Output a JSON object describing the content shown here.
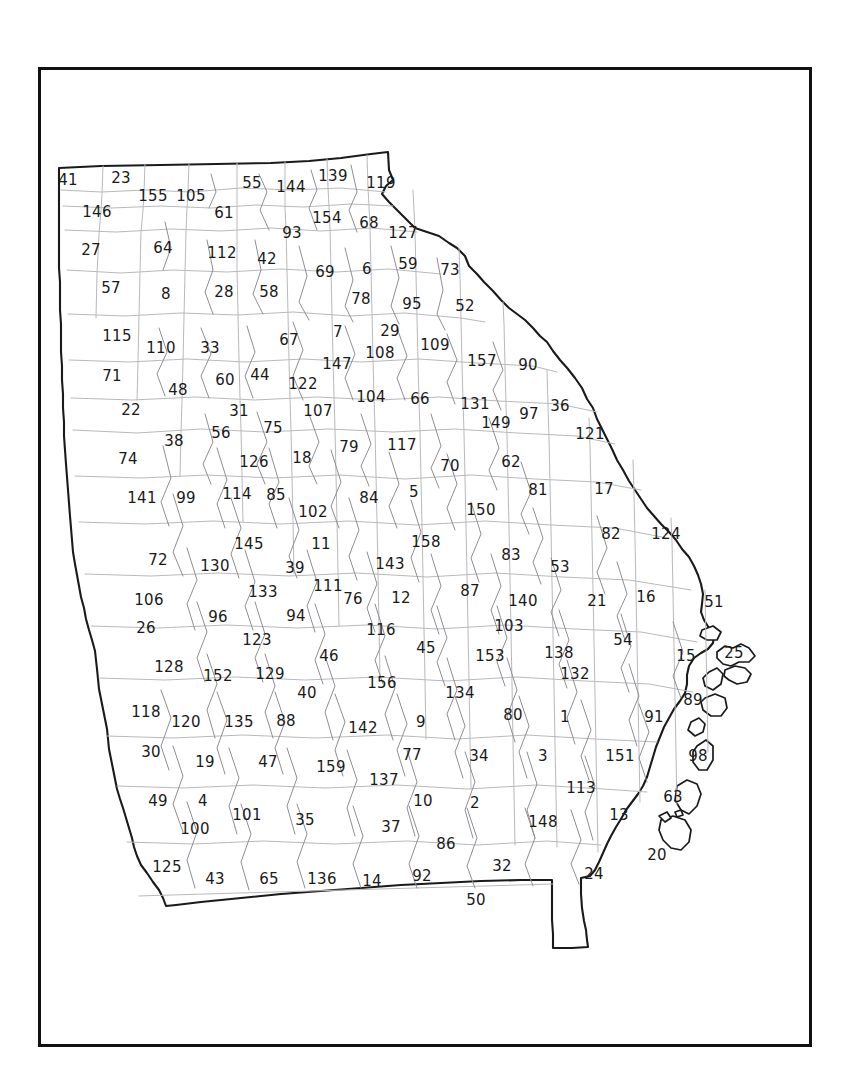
{
  "figure": {
    "type": "reference-map",
    "frame_color": "#111111",
    "outline_color": "#1a1a1a",
    "county_boundary_color": "#b9b9bd",
    "label_color": "#1a1a1a",
    "background_color": "#ffffff",
    "label_count": 159
  },
  "map": {
    "counties": [
      {
        "id": "41",
        "label": "41",
        "x": 27,
        "y": 110
      },
      {
        "id": "23",
        "label": "23",
        "x": 80,
        "y": 108
      },
      {
        "id": "55",
        "label": "55",
        "x": 211,
        "y": 113
      },
      {
        "id": "144",
        "label": "144",
        "x": 250,
        "y": 117
      },
      {
        "id": "139",
        "label": "139",
        "x": 292,
        "y": 106
      },
      {
        "id": "119",
        "label": "119",
        "x": 340,
        "y": 113
      },
      {
        "id": "155",
        "label": "155",
        "x": 112,
        "y": 126
      },
      {
        "id": "105",
        "label": "105",
        "x": 150,
        "y": 126
      },
      {
        "id": "146",
        "label": "146",
        "x": 56,
        "y": 142
      },
      {
        "id": "61",
        "label": "61",
        "x": 183,
        "y": 143
      },
      {
        "id": "154",
        "label": "154",
        "x": 286,
        "y": 148
      },
      {
        "id": "68",
        "label": "68",
        "x": 328,
        "y": 153
      },
      {
        "id": "127",
        "label": "127",
        "x": 362,
        "y": 163
      },
      {
        "id": "93",
        "label": "93",
        "x": 251,
        "y": 163
      },
      {
        "id": "27",
        "label": "27",
        "x": 50,
        "y": 180
      },
      {
        "id": "64",
        "label": "64",
        "x": 122,
        "y": 178
      },
      {
        "id": "112",
        "label": "112",
        "x": 181,
        "y": 183
      },
      {
        "id": "42",
        "label": "42",
        "x": 226,
        "y": 189
      },
      {
        "id": "69",
        "label": "69",
        "x": 284,
        "y": 202
      },
      {
        "id": "6",
        "label": "6",
        "x": 326,
        "y": 199
      },
      {
        "id": "59",
        "label": "59",
        "x": 367,
        "y": 194
      },
      {
        "id": "73",
        "label": "73",
        "x": 409,
        "y": 200
      },
      {
        "id": "57",
        "label": "57",
        "x": 70,
        "y": 218
      },
      {
        "id": "8",
        "label": "8",
        "x": 125,
        "y": 224
      },
      {
        "id": "28",
        "label": "28",
        "x": 183,
        "y": 222
      },
      {
        "id": "58",
        "label": "58",
        "x": 228,
        "y": 222
      },
      {
        "id": "78",
        "label": "78",
        "x": 320,
        "y": 229
      },
      {
        "id": "95",
        "label": "95",
        "x": 371,
        "y": 234
      },
      {
        "id": "52",
        "label": "52",
        "x": 424,
        "y": 236
      },
      {
        "id": "115",
        "label": "115",
        "x": 76,
        "y": 266
      },
      {
        "id": "110",
        "label": "110",
        "x": 120,
        "y": 278
      },
      {
        "id": "33",
        "label": "33",
        "x": 169,
        "y": 278
      },
      {
        "id": "67",
        "label": "67",
        "x": 248,
        "y": 270
      },
      {
        "id": "7",
        "label": "7",
        "x": 297,
        "y": 262
      },
      {
        "id": "29",
        "label": "29",
        "x": 349,
        "y": 261
      },
      {
        "id": "109",
        "label": "109",
        "x": 394,
        "y": 275
      },
      {
        "id": "108",
        "label": "108",
        "x": 339,
        "y": 283
      },
      {
        "id": "147",
        "label": "147",
        "x": 296,
        "y": 294
      },
      {
        "id": "157",
        "label": "157",
        "x": 441,
        "y": 291
      },
      {
        "id": "90",
        "label": "90",
        "x": 487,
        "y": 295
      },
      {
        "id": "71",
        "label": "71",
        "x": 71,
        "y": 306
      },
      {
        "id": "48",
        "label": "48",
        "x": 137,
        "y": 320
      },
      {
        "id": "60",
        "label": "60",
        "x": 184,
        "y": 310
      },
      {
        "id": "44",
        "label": "44",
        "x": 219,
        "y": 305
      },
      {
        "id": "122",
        "label": "122",
        "x": 262,
        "y": 314
      },
      {
        "id": "104",
        "label": "104",
        "x": 330,
        "y": 327
      },
      {
        "id": "66",
        "label": "66",
        "x": 379,
        "y": 329
      },
      {
        "id": "131",
        "label": "131",
        "x": 434,
        "y": 334
      },
      {
        "id": "97",
        "label": "97",
        "x": 488,
        "y": 344
      },
      {
        "id": "36",
        "label": "36",
        "x": 519,
        "y": 336
      },
      {
        "id": "22",
        "label": "22",
        "x": 90,
        "y": 340
      },
      {
        "id": "31",
        "label": "31",
        "x": 198,
        "y": 341
      },
      {
        "id": "107",
        "label": "107",
        "x": 277,
        "y": 341
      },
      {
        "id": "149",
        "label": "149",
        "x": 455,
        "y": 353
      },
      {
        "id": "121",
        "label": "121",
        "x": 549,
        "y": 364
      },
      {
        "id": "56",
        "label": "56",
        "x": 180,
        "y": 363
      },
      {
        "id": "75",
        "label": "75",
        "x": 232,
        "y": 358
      },
      {
        "id": "38",
        "label": "38",
        "x": 133,
        "y": 371
      },
      {
        "id": "79",
        "label": "79",
        "x": 308,
        "y": 377
      },
      {
        "id": "117",
        "label": "117",
        "x": 361,
        "y": 375
      },
      {
        "id": "74",
        "label": "74",
        "x": 87,
        "y": 389
      },
      {
        "id": "126",
        "label": "126",
        "x": 213,
        "y": 392
      },
      {
        "id": "18",
        "label": "18",
        "x": 261,
        "y": 388
      },
      {
        "id": "70",
        "label": "70",
        "x": 409,
        "y": 396
      },
      {
        "id": "62",
        "label": "62",
        "x": 470,
        "y": 392
      },
      {
        "id": "17",
        "label": "17",
        "x": 563,
        "y": 419
      },
      {
        "id": "141",
        "label": "141",
        "x": 101,
        "y": 428
      },
      {
        "id": "99",
        "label": "99",
        "x": 145,
        "y": 428
      },
      {
        "id": "114",
        "label": "114",
        "x": 196,
        "y": 424
      },
      {
        "id": "85",
        "label": "85",
        "x": 235,
        "y": 425
      },
      {
        "id": "102",
        "label": "102",
        "x": 272,
        "y": 442
      },
      {
        "id": "84",
        "label": "84",
        "x": 328,
        "y": 428
      },
      {
        "id": "5",
        "label": "5",
        "x": 373,
        "y": 422
      },
      {
        "id": "150",
        "label": "150",
        "x": 440,
        "y": 440
      },
      {
        "id": "81",
        "label": "81",
        "x": 497,
        "y": 420
      },
      {
        "id": "82",
        "label": "82",
        "x": 570,
        "y": 464
      },
      {
        "id": "124",
        "label": "124",
        "x": 625,
        "y": 464
      },
      {
        "id": "145",
        "label": "145",
        "x": 208,
        "y": 474
      },
      {
        "id": "11",
        "label": "11",
        "x": 280,
        "y": 474
      },
      {
        "id": "158",
        "label": "158",
        "x": 385,
        "y": 472
      },
      {
        "id": "83",
        "label": "83",
        "x": 470,
        "y": 485
      },
      {
        "id": "72",
        "label": "72",
        "x": 117,
        "y": 490
      },
      {
        "id": "130",
        "label": "130",
        "x": 174,
        "y": 496
      },
      {
        "id": "39",
        "label": "39",
        "x": 254,
        "y": 498
      },
      {
        "id": "143",
        "label": "143",
        "x": 349,
        "y": 494
      },
      {
        "id": "53",
        "label": "53",
        "x": 519,
        "y": 497
      },
      {
        "id": "111",
        "label": "111",
        "x": 287,
        "y": 516
      },
      {
        "id": "106",
        "label": "106",
        "x": 108,
        "y": 530
      },
      {
        "id": "133",
        "label": "133",
        "x": 222,
        "y": 522
      },
      {
        "id": "76",
        "label": "76",
        "x": 312,
        "y": 529
      },
      {
        "id": "12",
        "label": "12",
        "x": 360,
        "y": 528
      },
      {
        "id": "87",
        "label": "87",
        "x": 429,
        "y": 521
      },
      {
        "id": "140",
        "label": "140",
        "x": 482,
        "y": 531
      },
      {
        "id": "21",
        "label": "21",
        "x": 556,
        "y": 531
      },
      {
        "id": "16",
        "label": "16",
        "x": 605,
        "y": 527
      },
      {
        "id": "51",
        "label": "51",
        "x": 673,
        "y": 532
      },
      {
        "id": "96",
        "label": "96",
        "x": 177,
        "y": 547
      },
      {
        "id": "94",
        "label": "94",
        "x": 255,
        "y": 546
      },
      {
        "id": "26",
        "label": "26",
        "x": 105,
        "y": 558
      },
      {
        "id": "116",
        "label": "116",
        "x": 340,
        "y": 560
      },
      {
        "id": "103",
        "label": "103",
        "x": 468,
        "y": 556
      },
      {
        "id": "123",
        "label": "123",
        "x": 216,
        "y": 570
      },
      {
        "id": "45",
        "label": "45",
        "x": 385,
        "y": 578
      },
      {
        "id": "153",
        "label": "153",
        "x": 449,
        "y": 586
      },
      {
        "id": "138",
        "label": "138",
        "x": 518,
        "y": 583
      },
      {
        "id": "54",
        "label": "54",
        "x": 582,
        "y": 570
      },
      {
        "id": "15",
        "label": "15",
        "x": 645,
        "y": 586
      },
      {
        "id": "25",
        "label": "25",
        "x": 693,
        "y": 583
      },
      {
        "id": "46",
        "label": "46",
        "x": 288,
        "y": 586
      },
      {
        "id": "128",
        "label": "128",
        "x": 128,
        "y": 597
      },
      {
        "id": "152",
        "label": "152",
        "x": 177,
        "y": 606
      },
      {
        "id": "129",
        "label": "129",
        "x": 229,
        "y": 604
      },
      {
        "id": "156",
        "label": "156",
        "x": 341,
        "y": 613
      },
      {
        "id": "132",
        "label": "132",
        "x": 534,
        "y": 604
      },
      {
        "id": "40",
        "label": "40",
        "x": 266,
        "y": 623
      },
      {
        "id": "134",
        "label": "134",
        "x": 419,
        "y": 623
      },
      {
        "id": "80",
        "label": "80",
        "x": 472,
        "y": 645
      },
      {
        "id": "1",
        "label": "1",
        "x": 524,
        "y": 647
      },
      {
        "id": "91",
        "label": "91",
        "x": 613,
        "y": 647
      },
      {
        "id": "89",
        "label": "89",
        "x": 652,
        "y": 630
      },
      {
        "id": "118",
        "label": "118",
        "x": 105,
        "y": 642
      },
      {
        "id": "120",
        "label": "120",
        "x": 145,
        "y": 652
      },
      {
        "id": "135",
        "label": "135",
        "x": 198,
        "y": 652
      },
      {
        "id": "88",
        "label": "88",
        "x": 245,
        "y": 651
      },
      {
        "id": "142",
        "label": "142",
        "x": 322,
        "y": 658
      },
      {
        "id": "9",
        "label": "9",
        "x": 380,
        "y": 652
      },
      {
        "id": "30",
        "label": "30",
        "x": 110,
        "y": 682
      },
      {
        "id": "19",
        "label": "19",
        "x": 164,
        "y": 692
      },
      {
        "id": "47",
        "label": "47",
        "x": 227,
        "y": 692
      },
      {
        "id": "159",
        "label": "159",
        "x": 290,
        "y": 697
      },
      {
        "id": "137",
        "label": "137",
        "x": 343,
        "y": 710
      },
      {
        "id": "77",
        "label": "77",
        "x": 371,
        "y": 685
      },
      {
        "id": "34",
        "label": "34",
        "x": 438,
        "y": 686
      },
      {
        "id": "3",
        "label": "3",
        "x": 502,
        "y": 686
      },
      {
        "id": "151",
        "label": "151",
        "x": 579,
        "y": 686
      },
      {
        "id": "98",
        "label": "98",
        "x": 657,
        "y": 686
      },
      {
        "id": "113",
        "label": "113",
        "x": 540,
        "y": 718
      },
      {
        "id": "49",
        "label": "49",
        "x": 117,
        "y": 731
      },
      {
        "id": "4",
        "label": "4",
        "x": 162,
        "y": 731
      },
      {
        "id": "101",
        "label": "101",
        "x": 206,
        "y": 745
      },
      {
        "id": "35",
        "label": "35",
        "x": 264,
        "y": 750
      },
      {
        "id": "10",
        "label": "10",
        "x": 382,
        "y": 731
      },
      {
        "id": "2",
        "label": "2",
        "x": 434,
        "y": 733
      },
      {
        "id": "37",
        "label": "37",
        "x": 350,
        "y": 757
      },
      {
        "id": "86",
        "label": "86",
        "x": 405,
        "y": 774
      },
      {
        "id": "148",
        "label": "148",
        "x": 502,
        "y": 752
      },
      {
        "id": "13",
        "label": "13",
        "x": 578,
        "y": 745
      },
      {
        "id": "63",
        "label": "63",
        "x": 632,
        "y": 727
      },
      {
        "id": "100",
        "label": "100",
        "x": 154,
        "y": 759
      },
      {
        "id": "125",
        "label": "125",
        "x": 126,
        "y": 797
      },
      {
        "id": "43",
        "label": "43",
        "x": 174,
        "y": 809
      },
      {
        "id": "65",
        "label": "65",
        "x": 228,
        "y": 809
      },
      {
        "id": "136",
        "label": "136",
        "x": 281,
        "y": 809
      },
      {
        "id": "14",
        "label": "14",
        "x": 331,
        "y": 811
      },
      {
        "id": "92",
        "label": "92",
        "x": 381,
        "y": 806
      },
      {
        "id": "32",
        "label": "32",
        "x": 461,
        "y": 796
      },
      {
        "id": "24",
        "label": "24",
        "x": 553,
        "y": 804
      },
      {
        "id": "20",
        "label": "20",
        "x": 616,
        "y": 785
      },
      {
        "id": "50",
        "label": "50",
        "x": 435,
        "y": 830
      }
    ]
  }
}
